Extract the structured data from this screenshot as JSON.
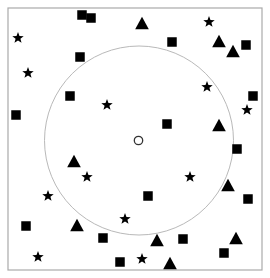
{
  "canvas": {
    "width": 270,
    "height": 278,
    "background": "#ffffff"
  },
  "frame": {
    "label": "plot border",
    "x": 8,
    "y": 8,
    "width": 254,
    "height": 262,
    "stroke": "#aaaaaa",
    "stroke_width": 1.2,
    "fill": "none"
  },
  "chart_data": {
    "type": "scatter",
    "title": "",
    "subtitle": "",
    "xlabel": "",
    "ylabel": "",
    "xlim": [
      8,
      262
    ],
    "ylim": [
      8,
      270
    ],
    "grid": false,
    "legend": false,
    "legend_position": "none",
    "annotations": [
      {
        "name": "reference-circle",
        "shape": "circle-outline",
        "cx": 139,
        "cy": 140.5,
        "r": 94.5,
        "stroke": "#b9b9b9",
        "stroke_width": 1.0,
        "fill": "none"
      },
      {
        "name": "center-point",
        "shape": "circle-outline",
        "cx": 138.5,
        "cy": 140.5,
        "r": 4.2,
        "stroke": "#333333",
        "stroke_width": 1.3,
        "fill": "#ffffff"
      }
    ],
    "marker_color": "#000000",
    "series": [
      {
        "name": "square",
        "marker": "square",
        "size": 9.5,
        "color": "#000000",
        "count": 17,
        "points": [
          [
            82,
            15
          ],
          [
            172,
            42
          ],
          [
            80,
            57
          ],
          [
            70,
            96
          ],
          [
            16,
            115
          ],
          [
            253,
            96
          ],
          [
            167,
            124
          ],
          [
            237,
            149
          ],
          [
            148,
            196
          ],
          [
            26,
            226
          ],
          [
            103,
            238
          ],
          [
            183,
            239
          ],
          [
            248,
            199
          ],
          [
            120,
            262
          ],
          [
            224,
            253
          ],
          [
            246,
            45
          ],
          [
            91,
            18
          ]
        ]
      },
      {
        "name": "triangle",
        "marker": "triangle-up",
        "size": 11,
        "color": "#000000",
        "count": 10,
        "points": [
          [
            142,
            23
          ],
          [
            219,
            41
          ],
          [
            233,
            51
          ],
          [
            219,
            125
          ],
          [
            74,
            161
          ],
          [
            228,
            185
          ],
          [
            157,
            240
          ],
          [
            77,
            225
          ],
          [
            170,
            263
          ],
          [
            236,
            238
          ]
        ]
      },
      {
        "name": "star",
        "marker": "star5",
        "size": 12,
        "color": "#000000",
        "count": 12,
        "points": [
          [
            18,
            38
          ],
          [
            209,
            22
          ],
          [
            28,
            73
          ],
          [
            207,
            87
          ],
          [
            247,
            110
          ],
          [
            107,
            105
          ],
          [
            87,
            177
          ],
          [
            190,
            177
          ],
          [
            48,
            196
          ],
          [
            125,
            219
          ],
          [
            38,
            257
          ],
          [
            142,
            259
          ]
        ]
      }
    ]
  }
}
